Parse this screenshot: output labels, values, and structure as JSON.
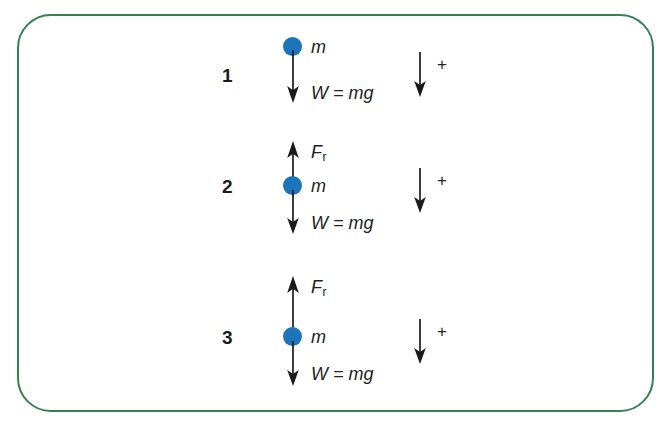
{
  "figure": {
    "frame_color": "#35814f",
    "mass_color": "#1d74ba",
    "arrow_color": "#1a1a1a"
  },
  "rows": [
    {
      "number": "1",
      "mass_label": "m",
      "weight_label": "W = mg",
      "resistive_label": null,
      "reference_plus": "+",
      "reference_direction": "down"
    },
    {
      "number": "2",
      "mass_label": "m",
      "weight_label": "W = mg",
      "resistive_label": "F",
      "resistive_subscript": "r",
      "reference_plus": "+",
      "reference_direction": "down"
    },
    {
      "number": "3",
      "mass_label": "m",
      "weight_label": "W = mg",
      "resistive_label": "F",
      "resistive_subscript": "r",
      "reference_plus": "+",
      "reference_direction": "down"
    }
  ]
}
